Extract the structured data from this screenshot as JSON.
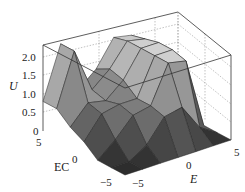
{
  "chart_data": {
    "type": "surface3d",
    "title": "",
    "xlabel": "E",
    "ylabel": "EC",
    "zlabel": "U",
    "x_ticks": [
      "-5",
      "0",
      "5"
    ],
    "y_ticks": [
      "5",
      "0",
      "-5"
    ],
    "z_ticks": [
      "0",
      "0.5",
      "1.0",
      "1.5",
      "2.0"
    ],
    "xlim": [
      -6,
      6
    ],
    "ylim": [
      -6,
      6
    ],
    "zlim": [
      0,
      2.3
    ],
    "grid": true,
    "colormap": "gray",
    "x": [
      -6,
      -4,
      -2,
      0,
      2,
      4,
      6
    ],
    "y": [
      -6,
      -4,
      -2,
      0,
      2,
      4,
      6
    ],
    "z_grid": [
      [
        0.0,
        0.0,
        0.0,
        0.0,
        0.0,
        0.0,
        0.0
      ],
      [
        0.0,
        0.0,
        0.3,
        0.9,
        1.0,
        0.3,
        0.0
      ],
      [
        0.0,
        0.4,
        0.9,
        1.0,
        2.0,
        1.9,
        0.0
      ],
      [
        0.3,
        0.9,
        1.0,
        1.0,
        2.0,
        2.0,
        0.0
      ],
      [
        0.5,
        1.0,
        0.9,
        1.3,
        2.0,
        2.0,
        0.0
      ],
      [
        0.8,
        2.2,
        1.0,
        1.4,
        2.0,
        1.9,
        0.0
      ],
      [
        0.8,
        2.2,
        0.8,
        1.2,
        1.9,
        1.8,
        0.0
      ]
    ]
  },
  "labels": {
    "z_axis_title": "U",
    "y_axis_title": "EC",
    "x_axis_title": "E",
    "z_tick_0": "0",
    "z_tick_05": "0.5",
    "z_tick_10": "1.0",
    "z_tick_15": "1.5",
    "z_tick_20": "2.0",
    "ec_tick_5": "5",
    "ec_tick_0": "0",
    "ec_tick_m5": "−5",
    "e_tick_m5": "−5",
    "e_tick_0": "0",
    "e_tick_5": "5"
  }
}
